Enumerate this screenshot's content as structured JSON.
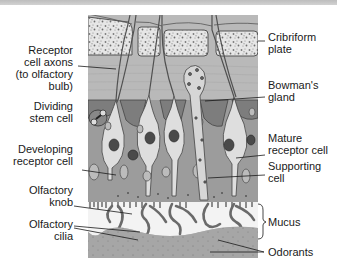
{
  "figure": {
    "colors": {
      "bone": "#e8e8e8",
      "bone_speckle": "#7a7a7a",
      "lamina": "#b8b8b8",
      "supporting": "#9a9a9a",
      "receptor": "#dcdcdc",
      "nucleus": "#4a4a4a",
      "mucus": "#f4f4f4",
      "cilia": "#6a6a6a",
      "odorant_layer": "#a8a8a8",
      "topbar": "#c4c4c4"
    }
  },
  "labels": {
    "left": [
      {
        "id": "receptor-axons",
        "text": "Receptor\ncell axons\n(to olfactory\nbulb)"
      },
      {
        "id": "dividing-stem-cell",
        "text": "Dividing\nstem cell"
      },
      {
        "id": "developing-receptor-cell",
        "text": "Developing\nreceptor cell"
      },
      {
        "id": "olfactory-knob",
        "text": "Olfactory\nknob"
      },
      {
        "id": "olfactory-cilia",
        "text": "Olfactory\ncilia"
      }
    ],
    "right": [
      {
        "id": "cribriform-plate",
        "text": "Cribriform\nplate"
      },
      {
        "id": "bowmans-gland",
        "text": "Bowman's\ngland"
      },
      {
        "id": "mature-receptor-cell",
        "text": "Mature\nreceptor cell"
      },
      {
        "id": "supporting-cell",
        "text": "Supporting\ncell"
      },
      {
        "id": "mucus",
        "text": "Mucus"
      },
      {
        "id": "odorants",
        "text": "Odorants"
      }
    ]
  }
}
